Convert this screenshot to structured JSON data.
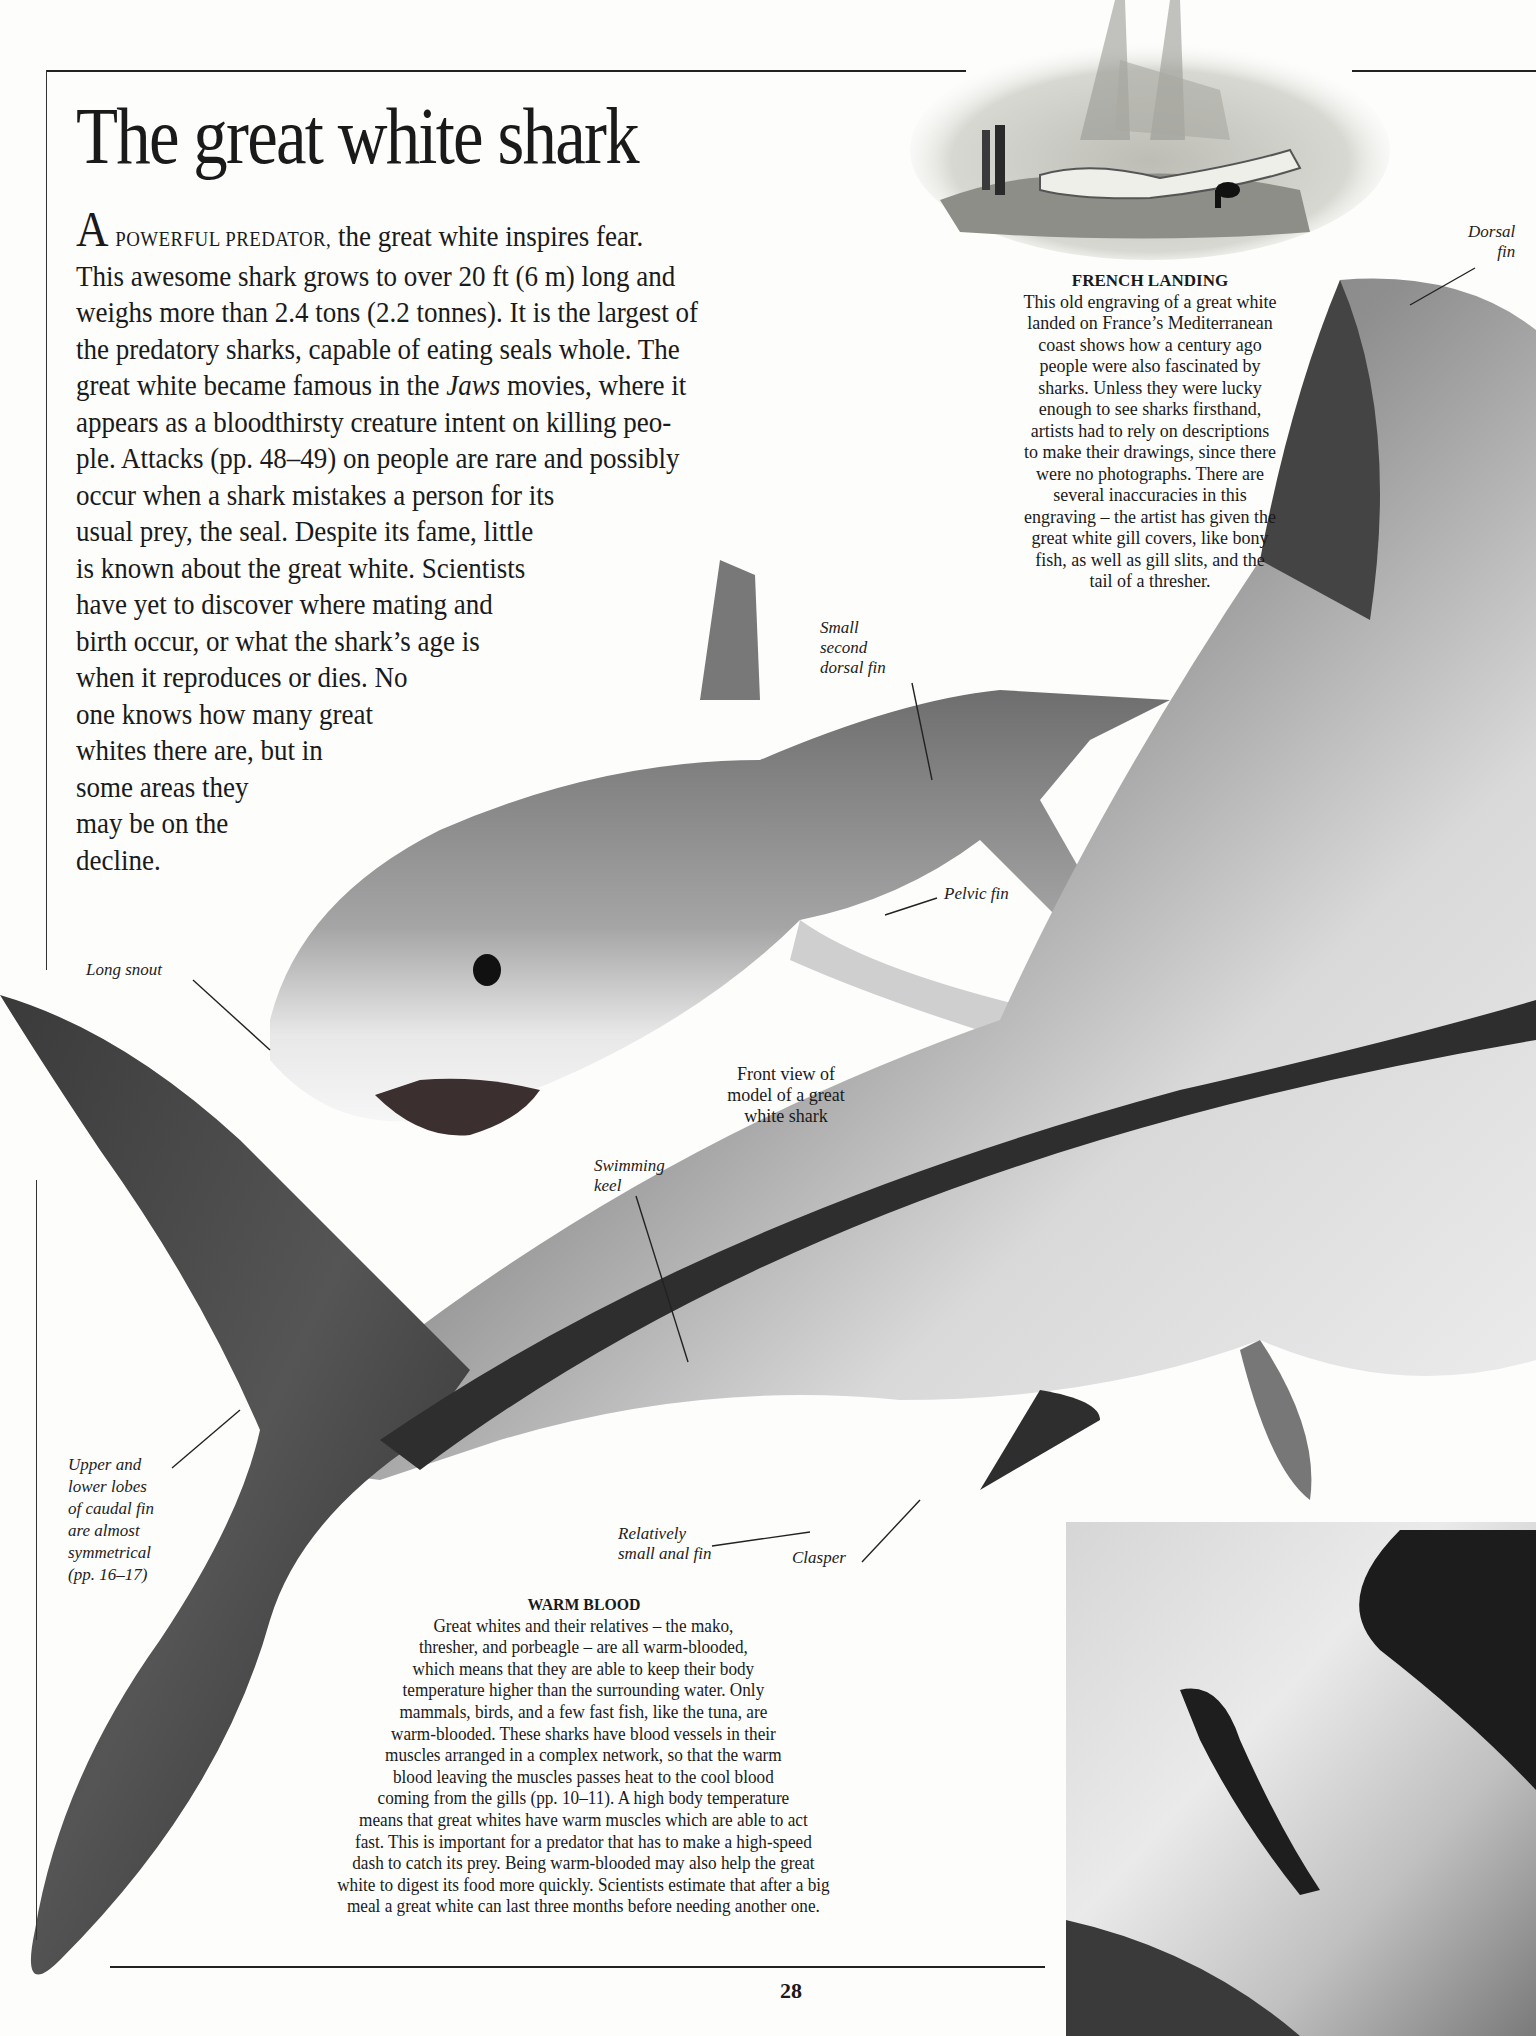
{
  "page": {
    "title": "The great white shark",
    "page_number": "28"
  },
  "intro": {
    "drop_cap": "A",
    "small_caps": "POWERFUL PREDATOR,",
    "lines": [
      " the great white inspires fear.",
      "This awesome shark grows to over 20 ft (6 m) long and",
      "weighs more than 2.4 tons (2.2 tonnes). It is the largest of",
      "the predatory sharks, capable of eating seals whole. The",
      "great white became famous in the ",
      " movies, where it",
      "appears as a bloodthirsty creature intent on killing peo-",
      "ple. Attacks (pp. 48–49) on people are rare and possibly",
      "occur when a shark mistakes a person for its",
      "usual prey, the seal. Despite its fame, little",
      "is known about the great white. Scientists",
      "have yet to discover where mating and",
      "birth occur, or what the shark’s age is",
      "when it reproduces or dies. No",
      "one knows how many great",
      "whites there are, but in",
      "some areas they",
      "may be on the",
      "decline."
    ],
    "italic_word": "Jaws"
  },
  "french_landing": {
    "heading": "FRENCH LANDING",
    "lines": [
      "This old engraving of a great white",
      "landed on France’s Mediterranean",
      "coast shows how a century ago",
      "people were also fascinated by",
      "sharks. Unless they were lucky",
      "enough to see sharks firsthand,",
      "artists had to rely on descriptions",
      "to make their drawings, since there",
      "were no photographs. There are",
      "several inaccuracies in this",
      "engraving – the artist has given the",
      "great white gill covers, like bony",
      "fish, as well as gill slits, and the",
      "tail of a thresher."
    ]
  },
  "warm_blood": {
    "heading": "WARM BLOOD",
    "lines": [
      "Great whites and their relatives – the mako,",
      "thresher, and porbeagle – are all warm-blooded,",
      "which means that they are able to keep their body",
      "temperature higher than the surrounding water. Only",
      "mammals, birds, and a few fast fish, like the tuna, are",
      "warm-blooded. These sharks have blood vessels in their",
      "muscles arranged in a complex network, so that the warm",
      "blood leaving the muscles passes heat to the cool blood",
      "coming from the gills (pp. 10–11). A high body temperature",
      "means that great whites have warm muscles which are able to act",
      "fast. This is important for a predator that has to make a high-speed",
      "dash to catch its prey. Being warm-blooded may also help the great",
      "white to digest its food more quickly. Scientists estimate that after a big",
      "meal a great white can last three months before needing another one."
    ]
  },
  "labels": {
    "dorsal_fin": [
      "Dorsal",
      "fin"
    ],
    "small_second_dorsal_fin": [
      "Small",
      "second",
      "dorsal fin"
    ],
    "pelvic_fin": [
      "Pelvic fin"
    ],
    "long_snout": [
      "Long snout"
    ],
    "front_view": [
      "Front view of",
      "model of a great",
      "white shark"
    ],
    "swimming_keel": [
      "Swimming",
      "keel"
    ],
    "caudal_fin": [
      "Upper and",
      "lower lobes",
      "of caudal fin",
      "are almost",
      "symmetrical",
      "(pp. 16–17)"
    ],
    "anal_fin": [
      "Relatively",
      "small anal fin"
    ],
    "clasper": [
      "Clasper"
    ]
  },
  "images": {
    "engraving": "engraving of a great white shark landed on a French beach with a ship, people and a dog",
    "model_front": "front view of model of a great white shark",
    "model_side": "large side view of a great white shark model",
    "water_photo": "photo of a great white shark breaching through water spray"
  }
}
